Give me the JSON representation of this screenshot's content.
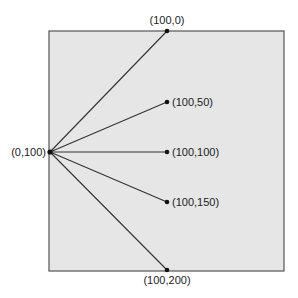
{
  "diagram": {
    "canvas": {
      "fill": "#e6e6e6",
      "stroke": "#555555",
      "x": 49,
      "y": 31,
      "width": 235,
      "height": 240
    },
    "line_color": "#333333",
    "point_color": "#111111",
    "origin": {
      "label": "(0,100)",
      "x": 50,
      "y": 152
    },
    "targets": [
      {
        "label": "(100,0)",
        "x": 167,
        "y": 31,
        "label_pos": "above"
      },
      {
        "label": "(100,50)",
        "x": 167,
        "y": 102,
        "label_pos": "right"
      },
      {
        "label": "(100,100)",
        "x": 167,
        "y": 152,
        "label_pos": "right"
      },
      {
        "label": "(100,150)",
        "x": 167,
        "y": 202,
        "label_pos": "right"
      },
      {
        "label": "(100,200)",
        "x": 167,
        "y": 270,
        "label_pos": "below"
      }
    ]
  }
}
